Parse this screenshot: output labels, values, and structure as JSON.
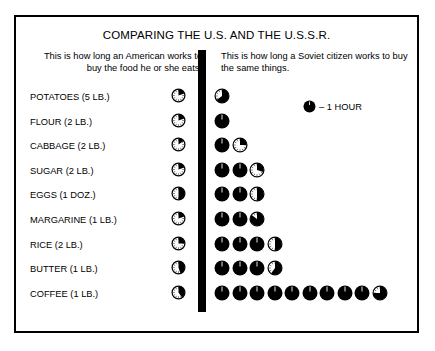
{
  "title": "COMPARING THE U.S. AND THE U.S.S.R.",
  "intro": {
    "left": "This is how long an American works to buy the food he or she eats.",
    "right": "This is how long a Soviet citizen works to buy the same things."
  },
  "legend": {
    "label": "– 1 HOUR",
    "swatch": "filled-circle-icon"
  },
  "colors": {
    "ink": "#000000",
    "paper": "#ffffff"
  },
  "chart_data": {
    "type": "bar",
    "title": "COMPARING THE U.S. AND THE U.S.S.R.",
    "subtitle": "Work-time required to buy common food items",
    "xlabel": "Hours of work (1 circle = 1 hour)",
    "ylabel": "Food item",
    "unit": "hours",
    "unit_label": "1 HOUR",
    "legend_position": "top-right",
    "grid": false,
    "xlim": [
      0,
      10
    ],
    "categories": [
      "POTATOES (5 LB.)",
      "FLOUR (2 LB.)",
      "CABBAGE (2 LB.)",
      "SUGAR (2 LB.)",
      "EGGS (1 DOZ.)",
      "MARGARINE (1 LB.)",
      "RICE (2 LB.)",
      "BUTTER (1 LB.)",
      "COFFEE (1 LB.)"
    ],
    "series": [
      {
        "name": "United States",
        "values": [
          0.2,
          0.2,
          0.15,
          0.2,
          0.5,
          0.2,
          0.25,
          0.45,
          0.4
        ]
      },
      {
        "name": "Soviet Union",
        "values": [
          0.65,
          1.0,
          1.25,
          2.3,
          2.5,
          2.85,
          3.5,
          3.6,
          9.75
        ]
      }
    ]
  },
  "rows": [
    {
      "label": "POTATOES (5 LB.)",
      "us": {
        "full": 0,
        "partial": 0.2
      },
      "ussr": {
        "full": 0,
        "partial": 0.65
      }
    },
    {
      "label": "FLOUR (2 LB.)",
      "us": {
        "full": 0,
        "partial": 0.2
      },
      "ussr": {
        "full": 1,
        "partial": 0
      }
    },
    {
      "label": "CABBAGE (2 LB.)",
      "us": {
        "full": 0,
        "partial": 0.15
      },
      "ussr": {
        "full": 1,
        "partial": 0.25
      }
    },
    {
      "label": "SUGAR (2 LB.)",
      "us": {
        "full": 0,
        "partial": 0.2
      },
      "ussr": {
        "full": 2,
        "partial": 0.3
      }
    },
    {
      "label": "EGGS (1 DOZ.)",
      "us": {
        "full": 0,
        "partial": 0.5
      },
      "ussr": {
        "full": 2,
        "partial": 0.5
      }
    },
    {
      "label": "MARGARINE (1 LB.)",
      "us": {
        "full": 0,
        "partial": 0.2
      },
      "ussr": {
        "full": 2,
        "partial": 0.85
      }
    },
    {
      "label": "RICE (2 LB.)",
      "us": {
        "full": 0,
        "partial": 0.25
      },
      "ussr": {
        "full": 3,
        "partial": 0.5
      }
    },
    {
      "label": "BUTTER (1 LB.)",
      "us": {
        "full": 0,
        "partial": 0.45
      },
      "ussr": {
        "full": 3,
        "partial": 0.6
      }
    },
    {
      "label": "COFFEE (1 LB.)",
      "us": {
        "full": 0,
        "partial": 0.4
      },
      "ussr": {
        "full": 9,
        "partial": 0.75
      }
    }
  ]
}
